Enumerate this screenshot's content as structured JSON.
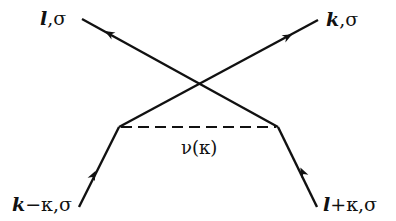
{
  "diagram": {
    "type": "feynman-exchange-diagram",
    "line_color": "#111111",
    "background": "#ffffff",
    "labels": {
      "top_left": {
        "momentum": "l",
        "rest": ",σ"
      },
      "top_right": {
        "momentum": "k",
        "rest": ",σ"
      },
      "bottom_left": {
        "momentum": "k",
        "rest": "−κ,σ"
      },
      "bottom_right": {
        "momentum": "l",
        "rest": "+κ,σ"
      },
      "interaction": "ν(κ)"
    },
    "vertices": {
      "left": [
        119,
        127
      ],
      "right": [
        278,
        127
      ],
      "crossing": [
        199,
        84
      ]
    },
    "lines": [
      {
        "name": "incoming-k-minus-kappa",
        "from": [
          79,
          207
        ],
        "to": [
          119,
          127
        ],
        "arrow": "toward-vertex",
        "style": "solid"
      },
      {
        "name": "incoming-l-plus-kappa",
        "from": [
          317,
          207
        ],
        "to": [
          278,
          127
        ],
        "arrow": "toward-vertex",
        "style": "solid"
      },
      {
        "name": "outgoing-k",
        "from": [
          119,
          127
        ],
        "to": [
          318,
          20
        ],
        "arrow": "outward",
        "style": "solid"
      },
      {
        "name": "outgoing-l",
        "from": [
          278,
          127
        ],
        "to": [
          82,
          19
        ],
        "arrow": "outward",
        "style": "solid"
      },
      {
        "name": "interaction-nu",
        "from": [
          119,
          127
        ],
        "to": [
          278,
          127
        ],
        "arrow": "none",
        "style": "dashed"
      }
    ]
  }
}
